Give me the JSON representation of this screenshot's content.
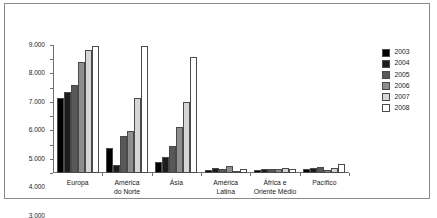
{
  "chart_data": {
    "type": "bar",
    "title": "",
    "subtitle": "",
    "xlabel": "",
    "ylabel": "",
    "categories": [
      "Europa",
      "América do Norte",
      "Ásia",
      "América Latina",
      "África e Oriente Médio",
      "Pacífico"
    ],
    "category_lines": [
      [
        "Europa"
      ],
      [
        "América",
        "do Norte"
      ],
      [
        "Ásia"
      ],
      [
        "América",
        "Latina"
      ],
      [
        "África e",
        "Oriente Médio"
      ],
      [
        "Pacífico"
      ]
    ],
    "series": [
      {
        "name": "2003",
        "color": "#000000",
        "values": [
          5250,
          1780,
          800,
          210,
          215,
          250
        ]
      },
      {
        "name": "2004",
        "color": "#1c1c1c",
        "values": [
          5720,
          550,
          1100,
          380,
          270,
          370
        ]
      },
      {
        "name": "2005",
        "color": "#585858",
        "values": [
          6170,
          2600,
          1930,
          300,
          250,
          390
        ]
      },
      {
        "name": "2006",
        "color": "#8e8e8e",
        "values": [
          7830,
          2980,
          3230,
          470,
          300,
          180
        ]
      },
      {
        "name": "2007",
        "color": "#d6d6d6",
        "values": [
          8650,
          5270,
          5000,
          140,
          330,
          330
        ]
      },
      {
        "name": "2008",
        "color": "#ffffff",
        "values": [
          8950,
          8900,
          8150,
          290,
          250,
          610
        ]
      }
    ],
    "ylim": [
      0,
      9000
    ],
    "yticks": [
      0,
      1000,
      2000,
      3000,
      4000,
      5000,
      6000,
      7000,
      8000,
      9000
    ],
    "ytick_labels": [
      "0",
      "1.000",
      "2.000",
      "3.000",
      "4.000",
      "5.000",
      "6.000",
      "7.000",
      "8.000",
      "9.000"
    ],
    "grid": false,
    "legend_position": "right",
    "legend_entries": [
      "2003",
      "2004",
      "2005",
      "2006",
      "2007",
      "2008"
    ],
    "annotations": []
  },
  "style": {
    "axis_color": "#6f6f6f",
    "border_color": "#8a8a8a",
    "text_color": "#1a1a1a",
    "background": "#ffffff"
  }
}
